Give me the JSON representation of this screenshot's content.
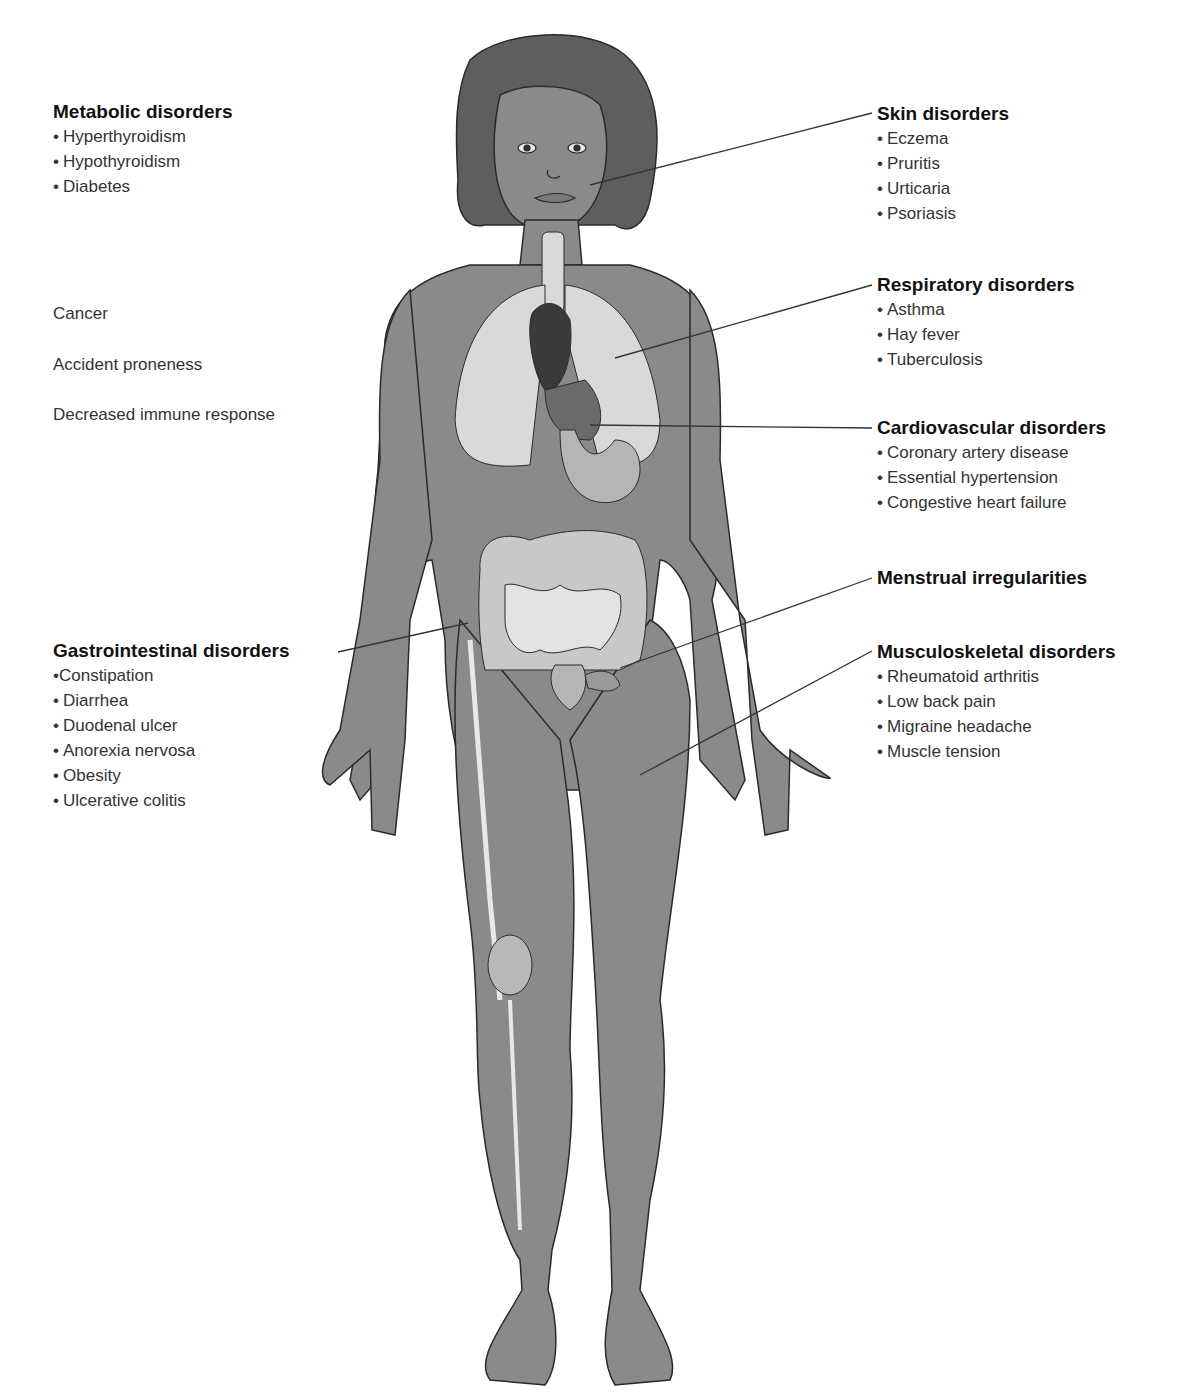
{
  "left_labels": {
    "metabolic": {
      "heading": "Metabolic disorders",
      "items": [
        "Hyperthyroidism",
        "Hypothyroidism",
        "Diabetes"
      ]
    },
    "general": [
      "Cancer",
      "Accident proneness",
      "Decreased immune response"
    ],
    "gastrointestinal": {
      "heading": "Gastrointestinal disorders",
      "items": [
        "Constipation",
        "Diarrhea",
        "Duodenal ulcer",
        "Anorexia nervosa",
        "Obesity",
        "Ulcerative colitis"
      ]
    }
  },
  "right_labels": {
    "skin": {
      "heading": "Skin disorders",
      "items": [
        "Eczema",
        "Pruritis",
        "Urticaria",
        "Psoriasis"
      ]
    },
    "respiratory": {
      "heading": "Respiratory disorders",
      "items": [
        "Asthma",
        "Hay fever",
        "Tuberculosis"
      ]
    },
    "cardiovascular": {
      "heading": "Cardiovascular disorders",
      "items": [
        "Coronary artery disease",
        "Essential hypertension",
        "Congestive heart failure"
      ]
    },
    "menstrual": {
      "heading": "Menstrual irregularities"
    },
    "musculoskeletal": {
      "heading": "Musculoskeletal disorders",
      "items": [
        "Rheumatoid arthritis",
        "Low back pain",
        "Migraine headache",
        "Muscle tension"
      ]
    }
  },
  "bullet": "•",
  "colors": {
    "skin": "#8a8a8a",
    "hair": "#5e5e5e",
    "organs_light": "#d9d9d9",
    "organs_mid": "#b5b5b5",
    "heart": "#3a3a3a",
    "outline": "#2a2a2a",
    "leader_line": "#333333"
  }
}
